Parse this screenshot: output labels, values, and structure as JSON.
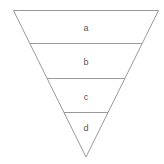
{
  "diagram": {
    "type": "inverted-triangle-funnel",
    "stroke_color": "#9a9a9a",
    "label_color": "#555555",
    "levels": [
      {
        "label": "a"
      },
      {
        "label": "b"
      },
      {
        "label": "c"
      },
      {
        "label": "d"
      }
    ]
  }
}
